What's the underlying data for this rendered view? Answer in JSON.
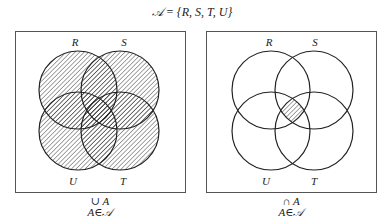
{
  "title": "𝒜 = {R, S, T, U}",
  "set_family_symbol": "𝒜",
  "sets": [
    "R",
    "S",
    "T",
    "U"
  ],
  "colors": {
    "stroke": "#222222",
    "box": "#555555",
    "hatch": "#333333",
    "background": "#ffffff"
  },
  "panels": [
    {
      "id": "union",
      "description": "Union of all sets in the family — every circle fully hatched",
      "labels": {
        "top_left": "R",
        "top_right": "S",
        "bottom_left": "U",
        "bottom_right": "T"
      },
      "caption_line1": "∪ A",
      "caption_line2": "A∈𝒜",
      "shaded_region": "R ∪ S ∪ T ∪ U"
    },
    {
      "id": "intersection",
      "description": "Intersection of all sets in the family — only the central four-way overlap hatched",
      "labels": {
        "top_left": "R",
        "top_right": "S",
        "bottom_left": "U",
        "bottom_right": "T"
      },
      "caption_line1": "∩ A",
      "caption_line2": "A∈𝒜",
      "shaded_region": "R ∩ S ∩ T ∩ U"
    }
  ]
}
